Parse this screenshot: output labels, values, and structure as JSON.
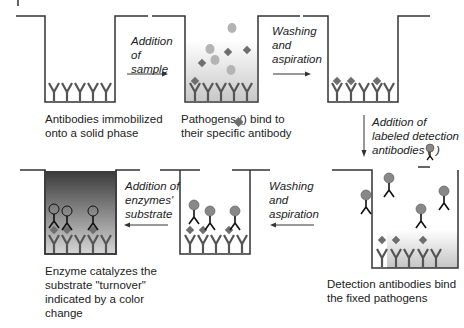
{
  "wells": [
    {
      "id": "well-1",
      "caption": [
        "Antibodies immobilized",
        "onto a solid phase"
      ]
    },
    {
      "id": "well-2",
      "caption": [
        "Pathogens (",
        ") bind to",
        "their specific antibody"
      ]
    },
    {
      "id": "well-3",
      "caption": []
    },
    {
      "id": "well-4",
      "caption": [
        "Detection antibodies bind",
        "the fixed pathogens"
      ]
    },
    {
      "id": "well-5",
      "caption": []
    },
    {
      "id": "well-6",
      "caption": [
        "Enzyme catalyzes the",
        "substrate \"turnover\"",
        "indicated by a color",
        "change"
      ]
    }
  ],
  "steps": [
    {
      "lines": [
        "Addition",
        "of",
        "sample"
      ],
      "direction": "right"
    },
    {
      "lines": [
        "Washing",
        "and",
        "aspiration"
      ],
      "direction": "right"
    },
    {
      "lines": [
        "Addition of",
        "labeled detection",
        "antibodies ("
      ],
      "suffix": ")",
      "direction": "down"
    },
    {
      "lines": [
        "Washing",
        "and",
        "aspiration"
      ],
      "direction": "left"
    },
    {
      "lines": [
        "Addition of",
        "enzymes'",
        "substrate"
      ],
      "direction": "left"
    }
  ],
  "legend": {
    "pathogen_icon": "diamond-icon",
    "detection_antibody_icon": "labeled-antibody-icon"
  },
  "colors": {
    "line": "#333333",
    "pathogen": "#6e6e6e",
    "sample_particle": "#b4b4b4",
    "label_head": "#888888",
    "enzyme_substrate_dark": "#3c3c3c",
    "enzyme_substrate_light": "#d8d8d8"
  }
}
